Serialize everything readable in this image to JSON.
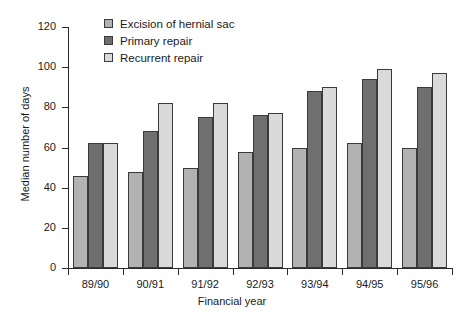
{
  "chart_data": {
    "type": "bar",
    "title": "",
    "xlabel": "Financial year",
    "ylabel": "Median number of days",
    "categories": [
      "89/90",
      "90/91",
      "91/92",
      "92/93",
      "93/94",
      "94/95",
      "95/96"
    ],
    "series": [
      {
        "name": "Excision of hernial sac",
        "color": "#b2b2b2",
        "values": [
          46,
          48,
          50,
          58,
          60,
          62,
          60
        ]
      },
      {
        "name": "Primary repair",
        "color": "#6f6f6f",
        "values": [
          62,
          68,
          75,
          76,
          88,
          94,
          90
        ]
      },
      {
        "name": "Recurrent repair",
        "color": "#dadada",
        "values": [
          62,
          82,
          82,
          77,
          90,
          99,
          97
        ]
      }
    ],
    "ylim": [
      0,
      120
    ],
    "yticks": [
      0,
      20,
      40,
      60,
      80,
      100,
      120
    ],
    "ytick_labels": [
      "0",
      "20",
      "40",
      "60",
      "80",
      "100",
      "120"
    ],
    "grid": false,
    "legend_position": "top-center"
  }
}
